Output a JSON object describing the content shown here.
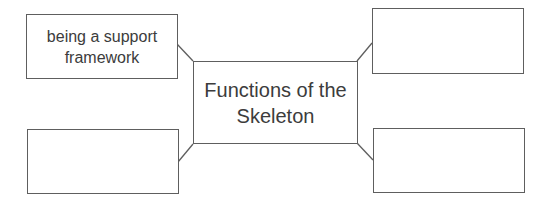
{
  "diagram": {
    "type": "spider-diagram",
    "center": {
      "label": "Functions of the Skeleton"
    },
    "branches": [
      {
        "position": "top-left",
        "label": "being a support framework"
      },
      {
        "position": "top-right",
        "label": ""
      },
      {
        "position": "bottom-left",
        "label": ""
      },
      {
        "position": "bottom-right",
        "label": ""
      }
    ],
    "colors": {
      "line": "#5e5e5e",
      "text": "#3c3c3c",
      "background": "#ffffff"
    }
  }
}
